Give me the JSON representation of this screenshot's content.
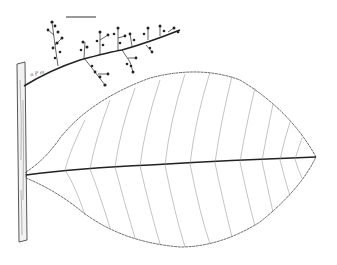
{
  "figure": {
    "type": "botanical line illustration",
    "annotation": "n P m",
    "colors": {
      "background": "#ffffff",
      "ink": "#333333",
      "vein": "#777777"
    }
  }
}
